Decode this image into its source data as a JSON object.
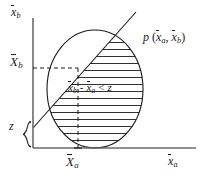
{
  "figure": {
    "kind": "statistical-diagram",
    "background_color": "#ffffff",
    "ink_color": "#1a1a1a",
    "axes": {
      "y_axis_label": {
        "symbol": "x",
        "overbar": true,
        "subscript": "b"
      },
      "x_axis_label": {
        "symbol": "x",
        "overbar": true,
        "subscript": "a"
      },
      "axis_color": "#6b6b6b",
      "origin_px": {
        "x": 33,
        "y": 148
      }
    },
    "ticks": {
      "y_tick": {
        "symbol": "X",
        "overbar": true,
        "subscript": "b",
        "y_px": 68
      },
      "x_tick": {
        "symbol": "X",
        "overbar": true,
        "subscript": "a",
        "x_px": 78
      }
    },
    "brace": {
      "label": "z",
      "label_italic": true,
      "span_px": {
        "top": 112,
        "bottom": 148
      },
      "x_px": 26
    },
    "distribution": {
      "label_prefix": "p",
      "label_args": [
        {
          "symbol": "x",
          "overbar": true,
          "subscript": "a"
        },
        {
          "symbol": "x",
          "overbar": true,
          "subscript": "b"
        }
      ],
      "shape": "circle",
      "center_px": {
        "x": 95,
        "y": 89
      },
      "radius_px": {
        "rx": 48,
        "ry": 59
      },
      "stroke_color": "#1a1a1a"
    },
    "boundary_line": {
      "meaning": "x_b - x_a = z",
      "from_px": {
        "x": 33,
        "y": 128
      },
      "to_px": {
        "x": 136,
        "y": 12
      },
      "stroke_color": "#1a1a1a"
    },
    "hatched_region": {
      "inequality": {
        "left_term": {
          "symbol": "x",
          "overbar": true,
          "subscript": "b"
        },
        "operator": "-",
        "right_term": {
          "symbol": "x",
          "overbar": true,
          "subscript": "a"
        },
        "relation": "<",
        "bound": "z"
      },
      "hatch_style": "horizontal-lines",
      "hatch_spacing_px": 7,
      "hatch_color": "#1a1a1a"
    },
    "dashed_guides": {
      "horizontal": {
        "from_px": {
          "x": 33,
          "y": 68
        },
        "to_px": {
          "x": 78,
          "y": 68
        }
      },
      "vertical": {
        "from_px": {
          "x": 78,
          "y": 68
        },
        "to_px": {
          "x": 78,
          "y": 148
        }
      },
      "color": "#1a1a1a"
    }
  }
}
